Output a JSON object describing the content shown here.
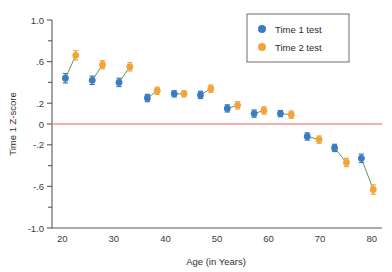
{
  "chart_data": {
    "type": "scatter",
    "title": "",
    "xlabel": "Age (in Years)",
    "ylabel": "Time 1 Z-score",
    "xlim": [
      18,
      82
    ],
    "ylim": [
      -1.0,
      1.0
    ],
    "grid": false,
    "legend_position": "top-right",
    "xticks": [
      20,
      30,
      40,
      50,
      60,
      70,
      80
    ],
    "xtick_labels": [
      "20",
      "30",
      "40",
      "50",
      "60",
      "70",
      "80"
    ],
    "yticks": [
      1.0,
      0.6,
      0.2,
      0,
      -0.2,
      -0.6,
      -1.0
    ],
    "ytick_labels": [
      "1.0",
      ".6",
      ".2",
      "0",
      "-.2",
      "-.6",
      "-1.0"
    ],
    "yticks_minor": [
      0.8,
      0.4,
      -0.4,
      -0.8
    ],
    "reference_line": {
      "y": 0,
      "color": "#f4958d",
      "label": "zero-reference"
    },
    "colors": {
      "time1": "#3a7cc4",
      "time2": "#f2a33c",
      "connector": "#4f8a43",
      "reference": "#f4958d"
    },
    "series": [
      {
        "name": "Time 1 test",
        "color": "#3a7cc4",
        "points": [
          {
            "x": 20.6,
            "y": 0.44,
            "err": 0.045
          },
          {
            "x": 25.8,
            "y": 0.42,
            "err": 0.04
          },
          {
            "x": 31.0,
            "y": 0.4,
            "err": 0.04
          },
          {
            "x": 36.5,
            "y": 0.25,
            "err": 0.035
          },
          {
            "x": 41.7,
            "y": 0.29,
            "err": 0.03
          },
          {
            "x": 46.8,
            "y": 0.28,
            "err": 0.035
          },
          {
            "x": 52.0,
            "y": 0.15,
            "err": 0.035
          },
          {
            "x": 57.2,
            "y": 0.1,
            "err": 0.035
          },
          {
            "x": 62.3,
            "y": 0.1,
            "err": 0.03
          },
          {
            "x": 67.5,
            "y": -0.12,
            "err": 0.035
          },
          {
            "x": 72.8,
            "y": -0.23,
            "err": 0.035
          },
          {
            "x": 78.0,
            "y": -0.33,
            "err": 0.04
          }
        ]
      },
      {
        "name": "Time 2 test",
        "color": "#f2a33c",
        "points": [
          {
            "x": 22.6,
            "y": 0.66,
            "err": 0.045
          },
          {
            "x": 27.8,
            "y": 0.57,
            "err": 0.04
          },
          {
            "x": 33.1,
            "y": 0.55,
            "err": 0.04
          },
          {
            "x": 38.4,
            "y": 0.32,
            "err": 0.035
          },
          {
            "x": 43.6,
            "y": 0.29,
            "err": 0.03
          },
          {
            "x": 48.8,
            "y": 0.34,
            "err": 0.035
          },
          {
            "x": 54.0,
            "y": 0.18,
            "err": 0.035
          },
          {
            "x": 59.1,
            "y": 0.13,
            "err": 0.035
          },
          {
            "x": 64.4,
            "y": 0.09,
            "err": 0.035
          },
          {
            "x": 69.8,
            "y": -0.15,
            "err": 0.035
          },
          {
            "x": 75.1,
            "y": -0.37,
            "err": 0.04
          },
          {
            "x": 80.3,
            "y": -0.63,
            "err": 0.045
          }
        ]
      }
    ],
    "pairs": [
      [
        0,
        0
      ],
      [
        1,
        1
      ],
      [
        2,
        2
      ],
      [
        3,
        3
      ],
      [
        4,
        4
      ],
      [
        5,
        5
      ],
      [
        6,
        6
      ],
      [
        7,
        7
      ],
      [
        8,
        8
      ],
      [
        9,
        9
      ],
      [
        10,
        10
      ],
      [
        11,
        11
      ]
    ]
  },
  "legend": {
    "entries": [
      {
        "label": "Time 1 test",
        "color": "#3a7cc4",
        "marker": "circle-marker"
      },
      {
        "label": "Time 2 test",
        "color": "#f2a33c",
        "marker": "circle-marker"
      }
    ]
  }
}
